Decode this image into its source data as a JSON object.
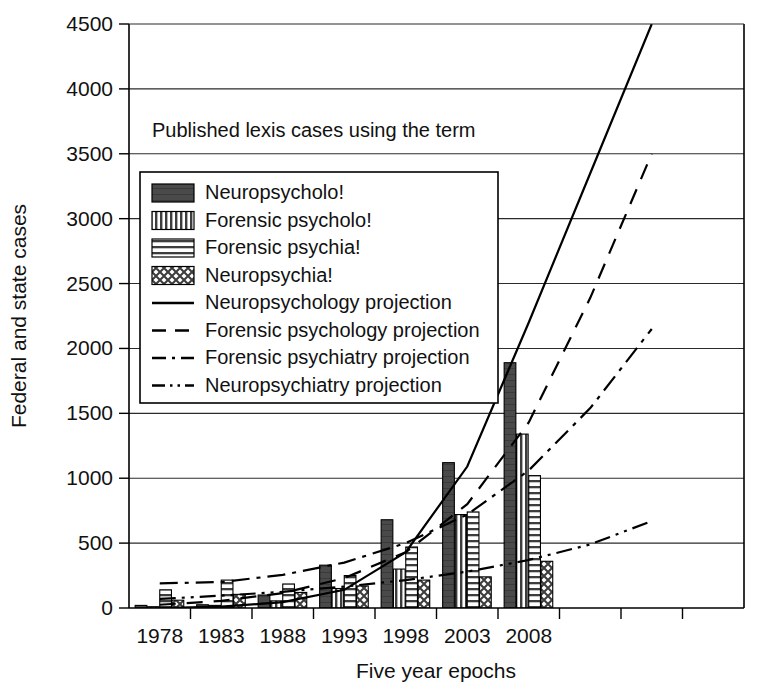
{
  "chart_data": {
    "type": "bar",
    "title": "Published lexis cases using the term",
    "xlabel": "Five year epochs",
    "ylabel": "Federal and state cases",
    "categories": [
      "1978",
      "1983",
      "1988",
      "1993",
      "1998",
      "2003",
      "2008"
    ],
    "x_tick_labels": [
      "1978",
      "1983",
      "1988",
      "1993",
      "1998",
      "2003",
      "2008",
      "",
      "",
      ""
    ],
    "y_ticks": [
      0,
      500,
      1000,
      1500,
      2000,
      2500,
      3000,
      3500,
      4000,
      4500
    ],
    "ylim": [
      0,
      4500
    ],
    "grid": true,
    "legend_position": "upper-left-inside",
    "series": [
      {
        "name": "Neuropsycholo!",
        "pattern": "solid-dark",
        "color": "#4d4d4d",
        "values": [
          20,
          25,
          100,
          330,
          680,
          1120,
          1890
        ]
      },
      {
        "name": "Forensic psycholo!",
        "pattern": "vertical-stripes",
        "color": "#8c8c8c",
        "values": [
          10,
          20,
          55,
          150,
          300,
          720,
          1340
        ]
      },
      {
        "name": "Forensic psychia!",
        "pattern": "horizontal-stripes",
        "color": "#b3b3b3",
        "values": [
          140,
          215,
          185,
          250,
          470,
          740,
          1020
        ]
      },
      {
        "name": "Neuropsychia!",
        "pattern": "crosshatch",
        "color": "#a6a6a6",
        "values": [
          60,
          105,
          120,
          170,
          215,
          240,
          360
        ]
      }
    ],
    "projections": [
      {
        "name": "Neuropsychology projection",
        "style": "solid",
        "dash": "none",
        "points": [
          [
            1978,
            0
          ],
          [
            1983,
            10
          ],
          [
            1988,
            45
          ],
          [
            1993,
            140
          ],
          [
            1998,
            430
          ],
          [
            2003,
            1090
          ],
          [
            2008,
            2200
          ],
          [
            2013,
            3350
          ],
          [
            2018,
            4500
          ]
        ]
      },
      {
        "name": "Forensic psychology projection",
        "style": "dashed",
        "dash": "16,11",
        "points": [
          [
            1978,
            25
          ],
          [
            1983,
            55
          ],
          [
            1988,
            115
          ],
          [
            1993,
            230
          ],
          [
            1998,
            430
          ],
          [
            2003,
            800
          ],
          [
            2008,
            1430
          ],
          [
            2013,
            2390
          ],
          [
            2018,
            3500
          ]
        ]
      },
      {
        "name": "Forensic psychiatry projection",
        "style": "dash-dot",
        "dash": "18,7,4,7",
        "points": [
          [
            1978,
            190
          ],
          [
            1983,
            200
          ],
          [
            1988,
            255
          ],
          [
            1993,
            350
          ],
          [
            1998,
            500
          ],
          [
            2003,
            720
          ],
          [
            2008,
            1060
          ],
          [
            2013,
            1540
          ],
          [
            2018,
            2150
          ]
        ]
      },
      {
        "name": "Neuropsychiatry projection",
        "style": "dash-dot-dot",
        "dash": "16,6,3,6,3,6",
        "points": [
          [
            1978,
            70
          ],
          [
            1983,
            95
          ],
          [
            1988,
            125
          ],
          [
            1993,
            165
          ],
          [
            1998,
            215
          ],
          [
            2003,
            280
          ],
          [
            2008,
            370
          ],
          [
            2013,
            490
          ],
          [
            2018,
            670
          ]
        ]
      }
    ],
    "legend_entries": [
      {
        "label": "Neuropsycholo!",
        "kind": "swatch",
        "pattern": "solid-dark"
      },
      {
        "label": "Forensic psycholo!",
        "kind": "swatch",
        "pattern": "vertical-stripes"
      },
      {
        "label": "Forensic psychia!",
        "kind": "swatch",
        "pattern": "horizontal-stripes"
      },
      {
        "label": "Neuropsychia!",
        "kind": "swatch",
        "pattern": "crosshatch"
      },
      {
        "label": "Neuropsychology projection",
        "kind": "line",
        "style": "solid"
      },
      {
        "label": "Forensic psychology projection",
        "kind": "line",
        "style": "dashed"
      },
      {
        "label": "Forensic psychiatry projection",
        "kind": "line",
        "style": "dash-dot"
      },
      {
        "label": "Neuropsychiatry projection",
        "kind": "line",
        "style": "dash-dot-dot"
      }
    ]
  }
}
